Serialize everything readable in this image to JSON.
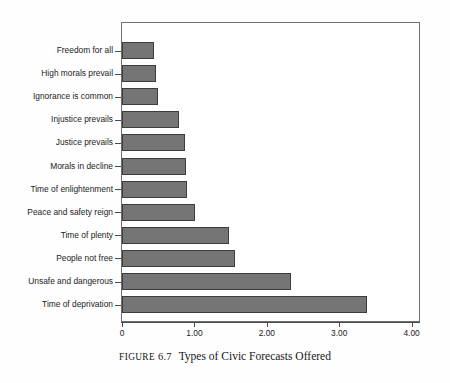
{
  "figure": {
    "caption_prefix": "FIGURE",
    "caption_number": "6.7",
    "caption_text": "Types of Civic Forecasts Offered"
  },
  "chart_data": {
    "type": "bar",
    "orientation": "horizontal",
    "title": "",
    "xlabel": "",
    "ylabel": "",
    "xlim": [
      0,
      4
    ],
    "grid": false,
    "legend": null,
    "bar_color": "#757575",
    "bar_border_color": "#3d3d3d",
    "xtick_labels": [
      "0",
      "1.00",
      "2.00",
      "3.00",
      "4.00"
    ],
    "xtick_values": [
      0,
      1,
      2,
      3,
      4
    ],
    "categories": [
      "Freedom for all",
      "High morals prevail",
      "Ignorance is common",
      "Injustice prevails",
      "Justice prevails",
      "Morals in decline",
      "Time of enlightenment",
      "Peace and safety reign",
      "Time of plenty",
      "People not free",
      "Unsafe and dangerous",
      "Time of deprivation"
    ],
    "values": [
      0.44,
      0.47,
      0.5,
      0.79,
      0.87,
      0.88,
      0.9,
      1.01,
      1.48,
      1.56,
      2.33,
      3.38
    ]
  }
}
